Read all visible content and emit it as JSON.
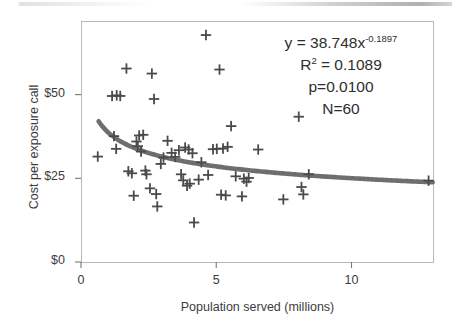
{
  "chart_data": {
    "type": "scatter",
    "title": "",
    "xlabel": "Population served (millions)",
    "ylabel": "Cost per exposure call",
    "xlim": [
      0,
      13.05
    ],
    "ylim": [
      0,
      72
    ],
    "xticks": [
      0,
      5,
      10
    ],
    "xticklabels": [
      "0",
      "5",
      "10"
    ],
    "yticks": [
      0,
      25,
      50
    ],
    "yticklabels": [
      "$0",
      "$25",
      "$50"
    ],
    "grid": false,
    "legend": null,
    "marker": "plus",
    "marker_color": "#4a4a4a",
    "points": [
      {
        "x": 0.62,
        "y": 31.5
      },
      {
        "x": 1.15,
        "y": 49.6
      },
      {
        "x": 1.32,
        "y": 49.8
      },
      {
        "x": 1.45,
        "y": 49.6
      },
      {
        "x": 1.22,
        "y": 37.6
      },
      {
        "x": 1.3,
        "y": 33.8
      },
      {
        "x": 1.68,
        "y": 57.8
      },
      {
        "x": 1.75,
        "y": 27.1
      },
      {
        "x": 1.88,
        "y": 26.5
      },
      {
        "x": 1.95,
        "y": 19.8
      },
      {
        "x": 2.05,
        "y": 36.0
      },
      {
        "x": 2.1,
        "y": 34.6
      },
      {
        "x": 2.15,
        "y": 37.8
      },
      {
        "x": 2.22,
        "y": 33.0
      },
      {
        "x": 2.3,
        "y": 38.0
      },
      {
        "x": 2.38,
        "y": 27.3
      },
      {
        "x": 2.42,
        "y": 26.2
      },
      {
        "x": 2.55,
        "y": 22.0
      },
      {
        "x": 2.62,
        "y": 56.3
      },
      {
        "x": 2.7,
        "y": 48.7
      },
      {
        "x": 2.78,
        "y": 20.3
      },
      {
        "x": 2.82,
        "y": 16.6
      },
      {
        "x": 2.95,
        "y": 29.3
      },
      {
        "x": 3.05,
        "y": 31.2
      },
      {
        "x": 3.2,
        "y": 36.2
      },
      {
        "x": 3.35,
        "y": 32.6
      },
      {
        "x": 3.48,
        "y": 31.4
      },
      {
        "x": 3.62,
        "y": 33.4
      },
      {
        "x": 3.7,
        "y": 26.2
      },
      {
        "x": 3.78,
        "y": 24.4
      },
      {
        "x": 3.85,
        "y": 34.2
      },
      {
        "x": 3.92,
        "y": 22.8
      },
      {
        "x": 3.98,
        "y": 33.6
      },
      {
        "x": 4.02,
        "y": 23.4
      },
      {
        "x": 4.12,
        "y": 32.5
      },
      {
        "x": 4.18,
        "y": 11.8
      },
      {
        "x": 4.35,
        "y": 24.6
      },
      {
        "x": 4.45,
        "y": 29.8
      },
      {
        "x": 4.62,
        "y": 67.8
      },
      {
        "x": 4.7,
        "y": 26.0
      },
      {
        "x": 4.88,
        "y": 33.7
      },
      {
        "x": 5.02,
        "y": 33.8
      },
      {
        "x": 5.12,
        "y": 57.5
      },
      {
        "x": 5.18,
        "y": 20.1
      },
      {
        "x": 5.25,
        "y": 33.9
      },
      {
        "x": 5.35,
        "y": 19.9
      },
      {
        "x": 5.42,
        "y": 34.4
      },
      {
        "x": 5.55,
        "y": 40.6
      },
      {
        "x": 5.72,
        "y": 25.6
      },
      {
        "x": 5.95,
        "y": 19.6
      },
      {
        "x": 6.02,
        "y": 24.9
      },
      {
        "x": 6.12,
        "y": 24.0
      },
      {
        "x": 6.2,
        "y": 25.1
      },
      {
        "x": 6.55,
        "y": 33.6
      },
      {
        "x": 7.48,
        "y": 18.7
      },
      {
        "x": 8.05,
        "y": 43.4
      },
      {
        "x": 8.15,
        "y": 22.4
      },
      {
        "x": 8.22,
        "y": 20.2
      },
      {
        "x": 8.42,
        "y": 26.2
      },
      {
        "x": 12.85,
        "y": 24.3
      }
    ],
    "fit_curve": {
      "type": "power",
      "coefficient": 38.748,
      "exponent": -0.1897,
      "color": "#6e6e6e",
      "x_start": 0.65,
      "x_end": 13.0
    },
    "annotations": [
      {
        "name": "equation",
        "text": "y = 38.748x",
        "sup": "-0.1897"
      },
      {
        "name": "r-squared",
        "text": "R",
        "sup": "2",
        "tail": " = 0.1089"
      },
      {
        "name": "p-value",
        "text": "p=0.0100"
      },
      {
        "name": "sample-size",
        "text": "N=60"
      }
    ]
  }
}
